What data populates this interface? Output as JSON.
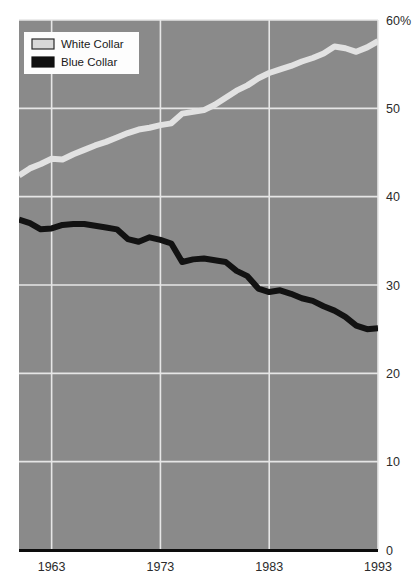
{
  "chart_data": {
    "type": "line",
    "title": "",
    "subtitle": "",
    "xlabel": "",
    "ylabel": "",
    "xlim": [
      1960,
      1993
    ],
    "ylim": [
      0,
      60
    ],
    "x_ticks": [
      "1963",
      "1973",
      "1983",
      "1993"
    ],
    "x_tick_values": [
      1963,
      1973,
      1983,
      1993
    ],
    "y_ticks": [
      "0",
      "10",
      "20",
      "30",
      "40",
      "50",
      "60%"
    ],
    "y_tick_values": [
      0,
      10,
      20,
      30,
      40,
      50,
      60
    ],
    "grid": true,
    "legend_position": "top-left",
    "x": [
      1960,
      1961,
      1962,
      1963,
      1964,
      1965,
      1966,
      1967,
      1968,
      1969,
      1970,
      1971,
      1972,
      1973,
      1974,
      1975,
      1976,
      1977,
      1978,
      1979,
      1980,
      1981,
      1982,
      1983,
      1984,
      1985,
      1986,
      1987,
      1988,
      1989,
      1990,
      1991,
      1992,
      1993
    ],
    "series": [
      {
        "name": "White Collar",
        "color": "#e2e2e2",
        "values": [
          42.4,
          43.2,
          43.7,
          44.3,
          44.2,
          44.8,
          45.3,
          45.8,
          46.2,
          46.7,
          47.2,
          47.6,
          47.8,
          48.1,
          48.3,
          49.4,
          49.6,
          49.8,
          50.4,
          51.2,
          52.0,
          52.6,
          53.4,
          54.0,
          54.4,
          54.8,
          55.3,
          55.7,
          56.2,
          57.0,
          56.8,
          56.4,
          56.9,
          57.6
        ]
      },
      {
        "name": "Blue Collar",
        "color": "#121212",
        "values": [
          37.4,
          37.0,
          36.3,
          36.4,
          36.8,
          36.9,
          36.9,
          36.7,
          36.5,
          36.3,
          35.2,
          34.9,
          35.4,
          35.1,
          34.7,
          32.6,
          32.9,
          33.0,
          32.8,
          32.6,
          31.6,
          31.0,
          29.6,
          29.2,
          29.4,
          29.0,
          28.5,
          28.2,
          27.6,
          27.1,
          26.4,
          25.4,
          25.0,
          25.1
        ]
      }
    ]
  },
  "legend": {
    "items": [
      {
        "label": "White Collar",
        "swatch": "#d8d8d8",
        "swatch_border": "#2a2a2a"
      },
      {
        "label": "Blue Collar",
        "swatch": "#101010",
        "swatch_border": "#101010"
      }
    ]
  },
  "colors": {
    "plot_background": "#8a8a8a",
    "gridline": "#e6e6e6",
    "axis_line": "#0d0d0d",
    "page_background": "#ffffff",
    "tick_text": "#2b2b2b",
    "legend_background": "#fdfdfd"
  }
}
